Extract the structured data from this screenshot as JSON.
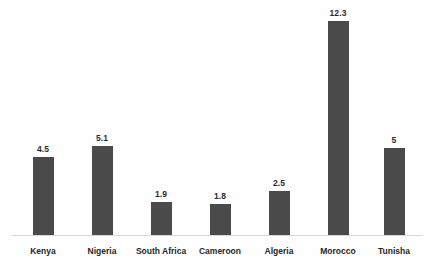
{
  "chart_data": {
    "type": "bar",
    "title": "",
    "subtitle": "",
    "xlabel": "",
    "ylabel": "",
    "categories": [
      "Kenya",
      "Nigeria",
      "South Africa",
      "Cameroon",
      "Algeria",
      "Morocco",
      "Tunisha"
    ],
    "values": [
      4.5,
      5.1,
      1.9,
      1.8,
      2.5,
      12.3,
      5
    ],
    "value_labels": [
      "4.5",
      "5.1",
      "1.9",
      "1.8",
      "2.5",
      "12.3",
      "5"
    ],
    "ylim": [
      0,
      13.5
    ],
    "grid": false,
    "legend": false,
    "legend_position": "none",
    "series": [
      {
        "name": "",
        "values": [
          4.5,
          5.1,
          1.9,
          1.8,
          2.5,
          12.3,
          5
        ],
        "color": "#4a4a4a"
      }
    ],
    "axis_labels_visible": false,
    "tick_labels": [],
    "annotations": []
  },
  "style": {
    "background": "#fefefe",
    "bar_color": "#4a4a4a",
    "axis_color": "#d7d7d7",
    "label_color": "#262626",
    "value_color": "#2b2b2b"
  }
}
